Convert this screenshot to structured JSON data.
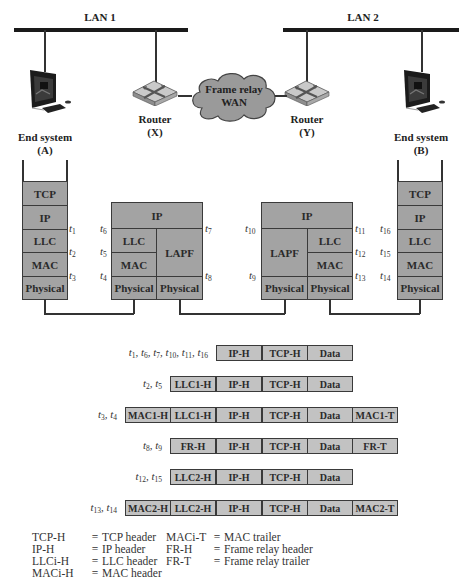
{
  "networks": {
    "lan1": {
      "label": "LAN 1"
    },
    "lan2": {
      "label": "LAN 2"
    },
    "wan": {
      "line1": "Frame relay",
      "line2": "WAN"
    }
  },
  "nodes": {
    "end_a": {
      "name": "End system",
      "id": "(A)"
    },
    "router_x": {
      "name": "Router",
      "id": "(X)"
    },
    "router_y": {
      "name": "Router",
      "id": "(Y)"
    },
    "end_b": {
      "name": "End system",
      "id": "(B)"
    }
  },
  "stacks": {
    "end_a": [
      "TCP",
      "IP",
      "LLC",
      "MAC",
      "Physical"
    ],
    "router_x": {
      "top": "IP",
      "left": [
        "LLC",
        "MAC",
        "Physical"
      ],
      "right": [
        "LAPF",
        "Physical"
      ]
    },
    "router_y": {
      "top": "IP",
      "left": [
        "LAPF",
        "Physical"
      ],
      "right": [
        "LLC",
        "MAC",
        "Physical"
      ]
    },
    "end_b": [
      "TCP",
      "IP",
      "LLC",
      "MAC",
      "Physical"
    ]
  },
  "time_points": {
    "t1": "1",
    "t2": "2",
    "t3": "3",
    "t4": "4",
    "t5": "5",
    "t6": "6",
    "t7": "7",
    "t8": "8",
    "t9": "9",
    "t10": "10",
    "t11": "11",
    "t12": "12",
    "t13": "13",
    "t14": "14",
    "t15": "15",
    "t16": "16"
  },
  "frames": [
    {
      "times": "t1, t6, t7, t10, t11, t16",
      "start_col": 2,
      "fields": [
        "IP-H",
        "TCP-H",
        "Data"
      ]
    },
    {
      "times": "t2, t5",
      "start_col": 1,
      "fields": [
        "LLC1-H",
        "IP-H",
        "TCP-H",
        "Data"
      ]
    },
    {
      "times": "t3, t4",
      "start_col": 0,
      "fields": [
        "MAC1-H",
        "LLC1-H",
        "IP-H",
        "TCP-H",
        "Data",
        "MAC1-T"
      ]
    },
    {
      "times": "t8, t9",
      "start_col": 1,
      "fields": [
        "FR-H",
        "IP-H",
        "TCP-H",
        "Data",
        "FR-T"
      ]
    },
    {
      "times": "t12, t15",
      "start_col": 1,
      "fields": [
        "LLC2-H",
        "IP-H",
        "TCP-H",
        "Data"
      ]
    },
    {
      "times": "t13, t14",
      "start_col": 0,
      "fields": [
        "MAC2-H",
        "LLC2-H",
        "IP-H",
        "TCP-H",
        "Data",
        "MAC2-T"
      ]
    }
  ],
  "legend": {
    "left": [
      {
        "abbr": "TCP-H",
        "meaning": "TCP header"
      },
      {
        "abbr": "IP-H",
        "meaning": "IP header"
      },
      {
        "abbr": "LLCi-H",
        "meaning": "LLC header"
      },
      {
        "abbr": "MACi-H",
        "meaning": "MAC header"
      }
    ],
    "right": [
      {
        "abbr": "MACi-T",
        "meaning": "MAC trailer"
      },
      {
        "abbr": "FR-H",
        "meaning": "Frame relay header"
      },
      {
        "abbr": "FR-T",
        "meaning": "Frame relay trailer"
      }
    ]
  },
  "colors": {
    "layer_fill": "#a3a3a3",
    "frame_fill": "#c2c2c2",
    "cloud_fill": "#9a9a9a",
    "line": "#333333"
  }
}
